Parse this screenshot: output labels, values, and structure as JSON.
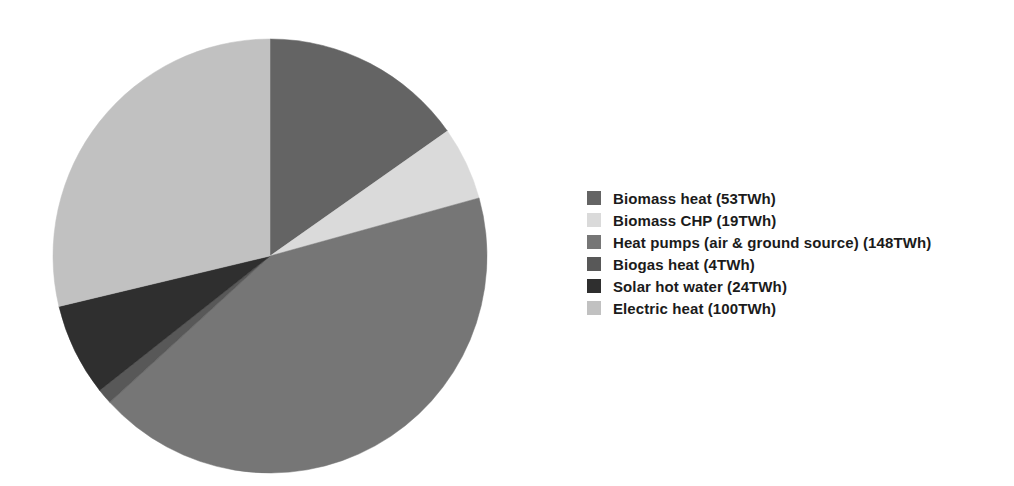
{
  "page": {
    "background": "#ffffff"
  },
  "chart_data": {
    "type": "pie",
    "title": "",
    "unit": "TWh",
    "total": 348,
    "start_angle_deg": 0,
    "direction": "clockwise",
    "legend_position": "right",
    "geometry_note": "pie starts at 12 o'clock, drawn clockwise, no slice gaps",
    "slices": [
      {
        "label": "Biomass heat",
        "value": 53,
        "display": "Biomass heat (53TWh)",
        "color": "#646464"
      },
      {
        "label": "Biomass CHP",
        "value": 19,
        "display": "Biomass CHP (19TWh)",
        "color": "#dadada"
      },
      {
        "label": "Heat pumps (air & ground source)",
        "value": 148,
        "display": "Heat pumps (air & ground source) (148TWh)",
        "color": "#767676"
      },
      {
        "label": "Biogas heat",
        "value": 4,
        "display": "Biogas heat (4TWh)",
        "color": "#585858"
      },
      {
        "label": "Solar hot water",
        "value": 24,
        "display": "Solar hot water (24TWh)",
        "color": "#2f2f2f"
      },
      {
        "label": "Electric heat",
        "value": 100,
        "display": "Electric heat (100TWh)",
        "color": "#c1c1c1"
      }
    ]
  }
}
